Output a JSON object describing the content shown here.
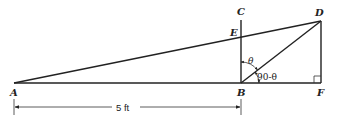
{
  "diagram": {
    "points": {
      "A": {
        "label": "A",
        "x": 14,
        "y": 83
      },
      "B": {
        "label": "B",
        "x": 241,
        "y": 83
      },
      "C": {
        "label": "C",
        "x": 241,
        "y": 20
      },
      "D": {
        "label": "D",
        "x": 321,
        "y": 21
      },
      "E": {
        "label": "E",
        "x": 241,
        "y": 37
      },
      "F": {
        "label": "F",
        "x": 321,
        "y": 83
      }
    },
    "segments": [
      "A-F",
      "A-D",
      "B-C",
      "B-D",
      "D-F"
    ],
    "angles": {
      "theta": {
        "label": "θ",
        "between": "BC and BD"
      },
      "complement": {
        "label": "90-θ",
        "between": "BD and BF"
      }
    },
    "right_angle_at": "F",
    "dimension": {
      "from": "A",
      "to": "B",
      "label": "5 ft"
    }
  }
}
